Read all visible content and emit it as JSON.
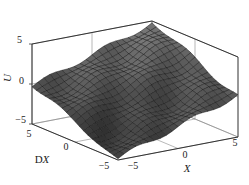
{
  "chart_data": {
    "type": "surface3d",
    "title": "",
    "zlabel": "U",
    "xlabel": "X",
    "ylabel": "DX",
    "xlim": [
      -5,
      5
    ],
    "ylim": [
      -5,
      5
    ],
    "zlim": [
      -5,
      5
    ],
    "x_ticks": [
      "-5",
      "0",
      "5"
    ],
    "y_ticks": [
      "5",
      "0",
      "-5"
    ],
    "z_ticks": [
      "5",
      "0",
      "-5"
    ],
    "grid": true,
    "box": true,
    "colormap": "gray shaded",
    "surface_description": "Wavy surface rising from about -5 at the front corner (X=-5, DX=-5) to about 5 at the back corner (X=5, DX=5); approximately U ≈ (X + DX)/2 with small ripples",
    "grid_size": [
      21,
      21
    ],
    "sample_values": {
      "x": [
        -5,
        -2.5,
        0,
        2.5,
        5
      ],
      "dx": [
        -5,
        -2.5,
        0,
        2.5,
        5
      ],
      "u": [
        [
          -5.0,
          -3.8,
          -2.5,
          -1.2,
          0.0
        ],
        [
          -3.8,
          -2.5,
          -1.2,
          0.0,
          1.2
        ],
        [
          -2.5,
          -1.2,
          0.0,
          1.2,
          2.5
        ],
        [
          -1.2,
          0.0,
          1.2,
          2.5,
          3.8
        ],
        [
          0.0,
          1.2,
          2.5,
          3.8,
          5.0
        ]
      ]
    }
  },
  "labels": {
    "z_axis": "U",
    "x_axis": "X",
    "y_axis": "DX",
    "z_tick_top": "5",
    "z_tick_mid": "0",
    "z_tick_bottom": "−5",
    "y_tick_5": "5",
    "y_tick_0": "0",
    "y_tick_m5": "−5",
    "x_tick_m5": "−5",
    "x_tick_0": "0",
    "x_tick_5": "5"
  }
}
